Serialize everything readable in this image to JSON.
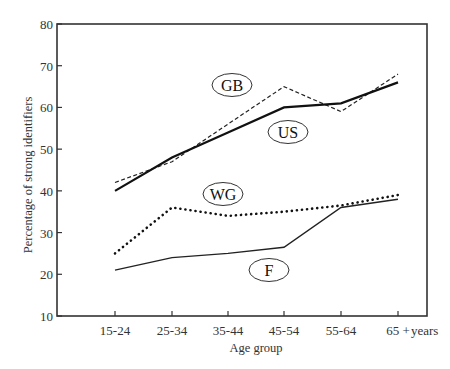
{
  "chart_data": {
    "type": "line",
    "title": "",
    "xlabel": "Age group",
    "ylabel": "Percentage of strong identifiers",
    "x_unit_label": "years",
    "categories": [
      "15-24",
      "25-34",
      "35-44",
      "45-54",
      "55-64",
      "65 +"
    ],
    "ylim": [
      10,
      80
    ],
    "yticks": [
      10,
      20,
      30,
      40,
      50,
      60,
      70,
      80
    ],
    "grid": false,
    "legend": "inline ellipse labels",
    "series": [
      {
        "name": "GB",
        "style": "dashed",
        "values": [
          42,
          47,
          56,
          65,
          59,
          68
        ]
      },
      {
        "name": "US",
        "style": "solid-thick",
        "values": [
          40,
          48,
          54,
          60,
          61,
          66
        ]
      },
      {
        "name": "WG",
        "style": "dotted",
        "values": [
          25,
          36,
          34,
          35,
          36.5,
          39
        ]
      },
      {
        "name": "F",
        "style": "solid-thin",
        "values": [
          21,
          24,
          25,
          26.5,
          36,
          38
        ]
      }
    ],
    "labels": [
      {
        "text": "GB",
        "cx": 232,
        "cy": 85
      },
      {
        "text": "US",
        "cx": 288,
        "cy": 132
      },
      {
        "text": "WG",
        "cx": 223,
        "cy": 194
      },
      {
        "text": "F",
        "cx": 269,
        "cy": 270
      }
    ]
  }
}
